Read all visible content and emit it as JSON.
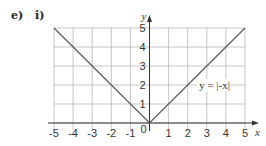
{
  "question": {
    "part": "e)",
    "subpart": "i)"
  },
  "chart_data": {
    "type": "line",
    "title": "",
    "xlabel": "x",
    "ylabel": "y",
    "xlim": [
      -5,
      5
    ],
    "ylim": [
      0,
      5
    ],
    "grid": true,
    "x_ticks": [
      "-5",
      "-4",
      "-3",
      "-2",
      "-1",
      "0",
      "1",
      "2",
      "3",
      "4",
      "5"
    ],
    "y_ticks": [
      "1",
      "2",
      "3",
      "4",
      "5"
    ],
    "origin_label": "0",
    "series": [
      {
        "name": "y = |-x|",
        "x": [
          -5,
          0,
          5
        ],
        "y": [
          5,
          0,
          5
        ]
      }
    ],
    "annotations": [
      {
        "text": "y = |-x|",
        "x": 2.6,
        "y": 1.8
      }
    ],
    "colors": {
      "grid": "#b8b8b8",
      "axis": "#333333",
      "line": "#555555"
    }
  }
}
